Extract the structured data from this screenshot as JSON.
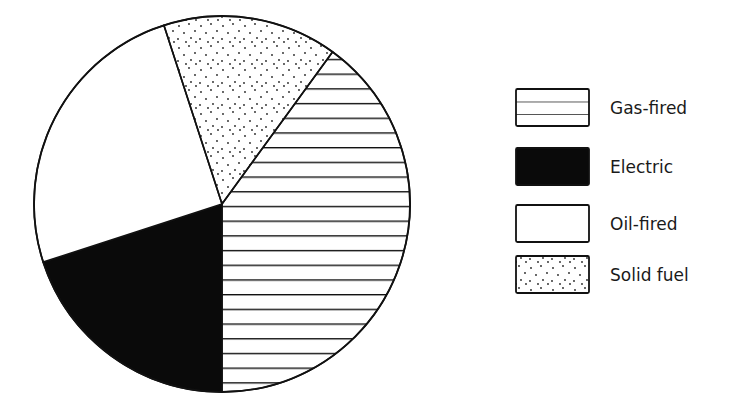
{
  "chart_data": {
    "type": "pie",
    "title": "",
    "start_angle_deg": 36,
    "direction": "clockwise",
    "slices": [
      {
        "name": "Gas-fired",
        "value": 40,
        "pattern": "horizontal-lines"
      },
      {
        "name": "Electric",
        "value": 20,
        "pattern": "solid-black"
      },
      {
        "name": "Oil-fired",
        "value": 25,
        "pattern": "blank"
      },
      {
        "name": "Solid fuel",
        "value": 15,
        "pattern": "dots"
      }
    ],
    "legend": {
      "position": "right",
      "entries": [
        "Gas-fired",
        "Electric",
        "Oil-fired",
        "Solid fuel"
      ]
    }
  },
  "colors": {
    "ink": "#111111",
    "background": "#ffffff"
  }
}
